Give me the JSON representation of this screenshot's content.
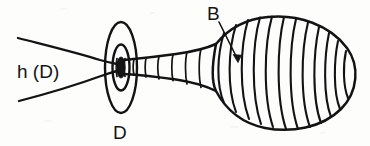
{
  "figure": {
    "background_color": "#fdfdfc",
    "ink_color": "#131313",
    "labels": {
      "horn": "h (D)",
      "disk": "D",
      "bulb": "B"
    },
    "annotations": [
      {
        "name": "horn-label",
        "text": "h (D)",
        "x": 17,
        "y": 78,
        "font_size": 19
      },
      {
        "name": "disk-label",
        "text": "D",
        "x": 113,
        "y": 139,
        "font_size": 19
      },
      {
        "name": "bulb-label",
        "text": "B",
        "x": 207,
        "y": 20,
        "font_size": 19
      }
    ],
    "leader_line": {
      "name": "bulb-leader",
      "from_x": 219,
      "from_y": 22,
      "to_x": 238,
      "to_y": 61
    },
    "parts": {
      "horn_flare": "funnel opening to the left",
      "neck": "narrow ribbed tube at the waist",
      "disk_rings": "concentric ellipses marking cross-section D",
      "bulb": "large ribbed bulb on the right"
    },
    "counts": {
      "neck_ribs": 5,
      "bulb_ribs": 14,
      "disk_rings": 3
    }
  }
}
